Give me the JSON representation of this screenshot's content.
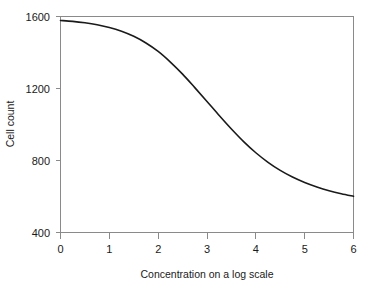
{
  "chart_data": {
    "type": "line",
    "title": "",
    "xlabel": "Concentration on a log scale",
    "ylabel": "Cell count",
    "xlim": [
      0,
      6
    ],
    "ylim": [
      400,
      1600
    ],
    "xticks": [
      "0",
      "1",
      "2",
      "3",
      "4",
      "5",
      "6"
    ],
    "yticks": [
      "400",
      "800",
      "1200",
      "1600"
    ],
    "grid": false,
    "legend": "none",
    "line_color": "#1a1a1a",
    "axis_color": "#8a8a8a",
    "series": [
      {
        "name": "Cell count",
        "x": [
          0.0,
          0.25,
          0.5,
          0.75,
          1.0,
          1.25,
          1.5,
          1.75,
          2.0,
          2.25,
          2.5,
          2.75,
          3.0,
          3.25,
          3.5,
          3.75,
          4.0,
          4.25,
          4.5,
          4.75,
          5.0,
          5.25,
          5.5,
          5.75,
          6.0
        ],
        "values": [
          1578,
          1573,
          1565,
          1554,
          1539,
          1518,
          1490,
          1453,
          1406,
          1347,
          1280,
          1205,
          1128,
          1050,
          975,
          905,
          843,
          790,
          745,
          708,
          678,
          653,
          632,
          615,
          601
        ]
      }
    ]
  },
  "axes": {
    "x_title": "Concentration on a log scale",
    "y_title": "Cell count",
    "x_tick_labels": [
      "0",
      "1",
      "2",
      "3",
      "4",
      "5",
      "6"
    ],
    "y_tick_labels": [
      "400",
      "800",
      "1200",
      "1600"
    ]
  }
}
